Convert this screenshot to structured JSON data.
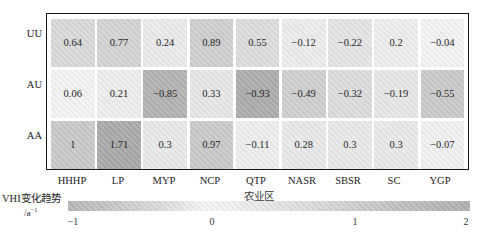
{
  "chart_data": {
    "type": "heatmap",
    "title": "",
    "xlabel": "农业区",
    "ylabel": "",
    "x_categories": [
      "HHHP",
      "LP",
      "MYP",
      "NCP",
      "QTP",
      "NASR",
      "SBSR",
      "SC",
      "YGP"
    ],
    "y_categories": [
      "UU",
      "AU",
      "AA"
    ],
    "values": [
      [
        0.64,
        0.77,
        0.24,
        0.89,
        0.55,
        -0.12,
        -0.22,
        0.2,
        -0.04
      ],
      [
        0.06,
        0.21,
        -0.85,
        0.33,
        -0.93,
        -0.49,
        -0.32,
        -0.19,
        -0.55
      ],
      [
        1,
        1.71,
        0.3,
        0.97,
        -0.11,
        0.28,
        0.3,
        0.3,
        -0.07
      ]
    ],
    "display_values": [
      [
        "0.64",
        "0.77",
        "0.24",
        "0.89",
        "0.55",
        "−0.12",
        "−0.22",
        "0.2",
        "−0.04"
      ],
      [
        "0.06",
        "0.21",
        "−0.85",
        "0.33",
        "−0.93",
        "−0.49",
        "−0.32",
        "−0.19",
        "−0.55"
      ],
      [
        "1",
        "1.71",
        "0.3",
        "0.97",
        "−0.11",
        "0.28",
        "0.3",
        "0.3",
        "−0.07"
      ]
    ],
    "colorbar": {
      "label": "VHI变化趋势",
      "unit": "/a",
      "unit_sup": "−1",
      "range": [
        -1,
        2
      ],
      "ticks": [
        "−1",
        "0",
        "1",
        "2"
      ],
      "colormap": "grayscale diverging (white at 0, darker with magnitude)"
    },
    "grid": false,
    "legend_position": "bottom colorbar"
  },
  "colors": {
    "frame": "#1a1a1a",
    "zero": "#f6f6f6",
    "neg_extreme": "#b0b0b0",
    "pos_extreme": "#a8a8a8"
  }
}
